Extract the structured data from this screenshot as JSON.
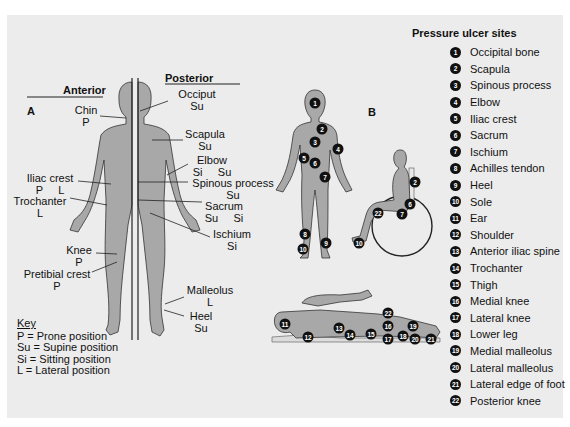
{
  "panel_a": {
    "letter": "A",
    "anterior_heading": "Anterior",
    "posterior_heading": "Posterior",
    "labels": [
      {
        "id": "chin",
        "name": "Chin",
        "position": "P"
      },
      {
        "id": "iliac-crest",
        "name": "Iliac crest",
        "position": "P     L"
      },
      {
        "id": "trochanter",
        "name": "Trochanter",
        "position": "L"
      },
      {
        "id": "knee",
        "name": "Knee",
        "position": "P"
      },
      {
        "id": "pretibial-crest",
        "name": "Pretibial crest",
        "position": "P"
      },
      {
        "id": "occiput",
        "name": "Occiput",
        "position": "Su"
      },
      {
        "id": "scapula",
        "name": "Scapula",
        "position": "Su"
      },
      {
        "id": "elbow",
        "name": "Elbow",
        "position": "Si     Su"
      },
      {
        "id": "spinous-process",
        "name": "Spinous process",
        "position": "Su"
      },
      {
        "id": "sacrum",
        "name": "Sacrum",
        "position": "Su     Si"
      },
      {
        "id": "ischium",
        "name": "Ischium",
        "position": "Si"
      },
      {
        "id": "malleolus",
        "name": "Malleolus",
        "position": "L"
      },
      {
        "id": "heel",
        "name": "Heel",
        "position": "Su"
      }
    ],
    "key": {
      "title": "Key",
      "items": [
        "P = Prone position",
        "Su = Supine position",
        "Si = Sitting position",
        "L = Lateral position"
      ]
    }
  },
  "panel_b": {
    "letter": "B",
    "standing_markers": [
      "1",
      "2",
      "3",
      "4",
      "5",
      "6",
      "7",
      "8",
      "9",
      "10",
      "10"
    ],
    "sitting_markers": [
      "2",
      "6",
      "7",
      "22",
      "10"
    ],
    "lying_markers": [
      "11",
      "12",
      "13",
      "14",
      "15",
      "16",
      "17",
      "18",
      "19",
      "20",
      "21",
      "22"
    ]
  },
  "legend": {
    "title": "Pressure ulcer sites",
    "items": [
      {
        "n": "1",
        "label": "Occipital bone"
      },
      {
        "n": "2",
        "label": "Scapula"
      },
      {
        "n": "3",
        "label": "Spinous process"
      },
      {
        "n": "4",
        "label": "Elbow"
      },
      {
        "n": "5",
        "label": "Iliac crest"
      },
      {
        "n": "6",
        "label": "Sacrum"
      },
      {
        "n": "7",
        "label": "Ischium"
      },
      {
        "n": "8",
        "label": "Achilles tendon"
      },
      {
        "n": "9",
        "label": "Heel"
      },
      {
        "n": "10",
        "label": "Sole"
      },
      {
        "n": "11",
        "label": "Ear"
      },
      {
        "n": "12",
        "label": "Shoulder"
      },
      {
        "n": "13",
        "label": "Anterior iliac spine"
      },
      {
        "n": "14",
        "label": "Trochanter"
      },
      {
        "n": "15",
        "label": "Thigh"
      },
      {
        "n": "16",
        "label": "Medial knee"
      },
      {
        "n": "17",
        "label": "Lateral knee"
      },
      {
        "n": "18",
        "label": "Lower leg"
      },
      {
        "n": "19",
        "label": "Medial malleolus"
      },
      {
        "n": "20",
        "label": "Lateral malleolus"
      },
      {
        "n": "21",
        "label": "Lateral edge of foot"
      },
      {
        "n": "22",
        "label": "Posterior knee"
      }
    ]
  },
  "colors": {
    "panel_bg": "#ececec",
    "body_fill": "#a8a8a8",
    "marker": "#111111"
  }
}
